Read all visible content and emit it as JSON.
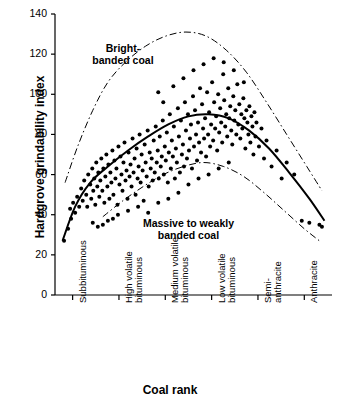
{
  "chart_data": {
    "type": "scatter",
    "title": "",
    "xlabel": "Coal rank",
    "ylabel": "Hardgrove grindability index",
    "ylim": [
      0,
      140
    ],
    "yticks": [
      0,
      20,
      40,
      60,
      80,
      100,
      120,
      140
    ],
    "grid": false,
    "xtick_labels": [
      "Subbituminous",
      "High volatile\nbituminous",
      "Medium volatile\nbituminous",
      "Low volatile\nbituminous",
      "Semi-\nanthracite",
      "Anthracite"
    ],
    "annotations": [
      {
        "text": "Bright-\nbanded coal",
        "x": 1.35,
        "y": 122
      },
      {
        "text": "Massive to weakly\nbanded coal",
        "x": 2.65,
        "y": 35
      }
    ],
    "series": [
      {
        "name": "Upper envelope (bright-banded coal)",
        "type": "line",
        "style": "dash-dot",
        "points": [
          [
            0.2,
            56
          ],
          [
            0.45,
            74
          ],
          [
            0.75,
            92
          ],
          [
            1.05,
            106
          ],
          [
            1.4,
            116
          ],
          [
            1.8,
            124
          ],
          [
            2.2,
            129
          ],
          [
            2.6,
            131
          ],
          [
            3.0,
            129
          ],
          [
            3.4,
            122
          ],
          [
            3.8,
            111
          ],
          [
            4.2,
            96
          ],
          [
            4.6,
            80
          ],
          [
            5.0,
            64
          ],
          [
            5.3,
            52
          ]
        ]
      },
      {
        "name": "Mean trend",
        "type": "line",
        "style": "solid",
        "points": [
          [
            0.15,
            27
          ],
          [
            0.4,
            44
          ],
          [
            0.7,
            56
          ],
          [
            1.05,
            64
          ],
          [
            1.45,
            72
          ],
          [
            1.85,
            79
          ],
          [
            2.25,
            85
          ],
          [
            2.65,
            89
          ],
          [
            3.05,
            90
          ],
          [
            3.45,
            88
          ],
          [
            3.85,
            82
          ],
          [
            4.25,
            73
          ],
          [
            4.65,
            61
          ],
          [
            5.05,
            48
          ],
          [
            5.35,
            37
          ]
        ]
      },
      {
        "name": "Lower envelope (massive to weakly banded coal)",
        "type": "line",
        "style": "dash-dot",
        "points": [
          [
            0.95,
            39
          ],
          [
            1.35,
            47
          ],
          [
            1.75,
            54
          ],
          [
            2.15,
            60
          ],
          [
            2.55,
            64
          ],
          [
            2.95,
            66
          ],
          [
            3.35,
            64
          ],
          [
            3.75,
            59
          ],
          [
            4.15,
            51
          ],
          [
            4.55,
            42
          ],
          [
            4.95,
            33
          ],
          [
            5.25,
            27
          ]
        ]
      }
    ],
    "scatter_points": [
      [
        0.18,
        27
      ],
      [
        0.26,
        33
      ],
      [
        0.32,
        38
      ],
      [
        0.3,
        43
      ],
      [
        0.36,
        46
      ],
      [
        0.4,
        41
      ],
      [
        0.44,
        49
      ],
      [
        0.48,
        44
      ],
      [
        0.52,
        53
      ],
      [
        0.55,
        47
      ],
      [
        0.58,
        57
      ],
      [
        0.62,
        50
      ],
      [
        0.64,
        44
      ],
      [
        0.66,
        60
      ],
      [
        0.7,
        55
      ],
      [
        0.72,
        48
      ],
      [
        0.74,
        63
      ],
      [
        0.76,
        52
      ],
      [
        0.78,
        58
      ],
      [
        0.8,
        45
      ],
      [
        0.82,
        66
      ],
      [
        0.84,
        54
      ],
      [
        0.86,
        61
      ],
      [
        0.88,
        49
      ],
      [
        0.9,
        57
      ],
      [
        0.92,
        68
      ],
      [
        0.94,
        52
      ],
      [
        0.96,
        63
      ],
      [
        0.98,
        46
      ],
      [
        1.0,
        59
      ],
      [
        1.02,
        70
      ],
      [
        1.04,
        54
      ],
      [
        1.06,
        65
      ],
      [
        1.08,
        48
      ],
      [
        1.1,
        61
      ],
      [
        1.12,
        56
      ],
      [
        1.14,
        72
      ],
      [
        1.16,
        50
      ],
      [
        1.18,
        67
      ],
      [
        1.2,
        58
      ],
      [
        1.22,
        63
      ],
      [
        1.24,
        45
      ],
      [
        1.26,
        74
      ],
      [
        1.28,
        55
      ],
      [
        1.3,
        69
      ],
      [
        1.32,
        60
      ],
      [
        1.34,
        52
      ],
      [
        1.36,
        66
      ],
      [
        1.38,
        76
      ],
      [
        1.4,
        57
      ],
      [
        1.42,
        62
      ],
      [
        1.44,
        48
      ],
      [
        1.46,
        71
      ],
      [
        1.48,
        59
      ],
      [
        1.5,
        65
      ],
      [
        1.52,
        54
      ],
      [
        1.54,
        78
      ],
      [
        1.56,
        61
      ],
      [
        1.58,
        68
      ],
      [
        1.6,
        50
      ],
      [
        1.62,
        73
      ],
      [
        1.64,
        58
      ],
      [
        1.66,
        64
      ],
      [
        1.68,
        80
      ],
      [
        1.7,
        56
      ],
      [
        1.72,
        70
      ],
      [
        1.74,
        62
      ],
      [
        1.76,
        47
      ],
      [
        1.78,
        75
      ],
      [
        1.8,
        66
      ],
      [
        1.82,
        59
      ],
      [
        1.84,
        82
      ],
      [
        1.86,
        54
      ],
      [
        1.88,
        71
      ],
      [
        1.9,
        63
      ],
      [
        1.92,
        68
      ],
      [
        1.94,
        57
      ],
      [
        1.96,
        77
      ],
      [
        1.98,
        61
      ],
      [
        2.0,
        84
      ],
      [
        2.02,
        66
      ],
      [
        2.04,
        72
      ],
      [
        2.06,
        58
      ],
      [
        2.08,
        79
      ],
      [
        2.1,
        64
      ],
      [
        2.12,
        69
      ],
      [
        2.14,
        87
      ],
      [
        2.16,
        60
      ],
      [
        2.18,
        74
      ],
      [
        2.2,
        67
      ],
      [
        2.22,
        81
      ],
      [
        2.24,
        56
      ],
      [
        2.26,
        71
      ],
      [
        2.28,
        90
      ],
      [
        2.3,
        63
      ],
      [
        2.32,
        77
      ],
      [
        2.34,
        69
      ],
      [
        2.36,
        84
      ],
      [
        2.38,
        58
      ],
      [
        2.4,
        73
      ],
      [
        2.42,
        66
      ],
      [
        2.44,
        93
      ],
      [
        2.46,
        79
      ],
      [
        2.48,
        61
      ],
      [
        2.5,
        87
      ],
      [
        2.52,
        70
      ],
      [
        2.54,
        75
      ],
      [
        2.56,
        64
      ],
      [
        2.58,
        96
      ],
      [
        2.6,
        82
      ],
      [
        2.62,
        68
      ],
      [
        2.64,
        90
      ],
      [
        2.66,
        72
      ],
      [
        2.68,
        78
      ],
      [
        2.7,
        85
      ],
      [
        2.72,
        63
      ],
      [
        2.74,
        99
      ],
      [
        2.76,
        74
      ],
      [
        2.78,
        92
      ],
      [
        2.8,
        80
      ],
      [
        2.82,
        67
      ],
      [
        2.84,
        86
      ],
      [
        2.86,
        76
      ],
      [
        2.88,
        103
      ],
      [
        2.9,
        71
      ],
      [
        2.92,
        95
      ],
      [
        2.94,
        83
      ],
      [
        2.96,
        78
      ],
      [
        2.98,
        88
      ],
      [
        3.0,
        69
      ],
      [
        3.02,
        101
      ],
      [
        3.04,
        80
      ],
      [
        3.06,
        91
      ],
      [
        3.08,
        74
      ],
      [
        3.1,
        85
      ],
      [
        3.12,
        106
      ],
      [
        3.14,
        77
      ],
      [
        3.16,
        96
      ],
      [
        3.18,
        83
      ],
      [
        3.2,
        89
      ],
      [
        3.22,
        72
      ],
      [
        3.24,
        100
      ],
      [
        3.26,
        81
      ],
      [
        3.28,
        93
      ],
      [
        3.3,
        86
      ],
      [
        3.32,
        76
      ],
      [
        3.34,
        110
      ],
      [
        3.36,
        97
      ],
      [
        3.38,
        84
      ],
      [
        3.4,
        90
      ],
      [
        3.42,
        79
      ],
      [
        3.44,
        103
      ],
      [
        3.46,
        88
      ],
      [
        3.48,
        94
      ],
      [
        3.5,
        82
      ],
      [
        3.52,
        75
      ],
      [
        3.54,
        99
      ],
      [
        3.56,
        87
      ],
      [
        3.58,
        92
      ],
      [
        3.6,
        80
      ],
      [
        3.62,
        105
      ],
      [
        3.64,
        85
      ],
      [
        3.66,
        95
      ],
      [
        3.68,
        78
      ],
      [
        3.7,
        90
      ],
      [
        3.72,
        83
      ],
      [
        3.74,
        98
      ],
      [
        3.76,
        88
      ],
      [
        3.78,
        73
      ],
      [
        3.8,
        92
      ],
      [
        3.82,
        86
      ],
      [
        3.84,
        80
      ],
      [
        3.86,
        94
      ],
      [
        3.88,
        76
      ],
      [
        3.9,
        89
      ],
      [
        3.92,
        84
      ],
      [
        3.94,
        70
      ],
      [
        3.96,
        91
      ],
      [
        3.98,
        79
      ],
      [
        4.0,
        86
      ],
      [
        4.05,
        74
      ],
      [
        4.1,
        83
      ],
      [
        4.15,
        68
      ],
      [
        4.2,
        77
      ],
      [
        4.3,
        64
      ],
      [
        4.4,
        72
      ],
      [
        4.5,
        58
      ],
      [
        4.6,
        66
      ],
      [
        4.75,
        60
      ],
      [
        4.9,
        37
      ],
      [
        5.05,
        36
      ],
      [
        5.25,
        35
      ],
      [
        5.3,
        34
      ],
      [
        1.15,
        38
      ],
      [
        1.25,
        40
      ],
      [
        1.45,
        42
      ],
      [
        1.65,
        44
      ],
      [
        1.85,
        41
      ],
      [
        2.05,
        46
      ],
      [
        2.25,
        48
      ],
      [
        2.45,
        51
      ],
      [
        2.65,
        55
      ],
      [
        2.85,
        58
      ],
      [
        3.05,
        60
      ],
      [
        3.25,
        63
      ],
      [
        3.45,
        66
      ],
      [
        0.95,
        35
      ],
      [
        1.05,
        37
      ],
      [
        0.85,
        34
      ],
      [
        0.75,
        36
      ],
      [
        2.15,
        96
      ],
      [
        2.35,
        104
      ],
      [
        2.55,
        108
      ],
      [
        2.75,
        112
      ],
      [
        2.95,
        115
      ],
      [
        3.15,
        118
      ],
      [
        3.35,
        116
      ],
      [
        3.55,
        112
      ],
      [
        3.75,
        106
      ],
      [
        2.05,
        101
      ]
    ]
  },
  "axes": {
    "plot_left": 55,
    "plot_right": 332,
    "plot_top": 14,
    "plot_bottom": 295,
    "x_data_min": 0,
    "x_data_max": 5.5
  }
}
